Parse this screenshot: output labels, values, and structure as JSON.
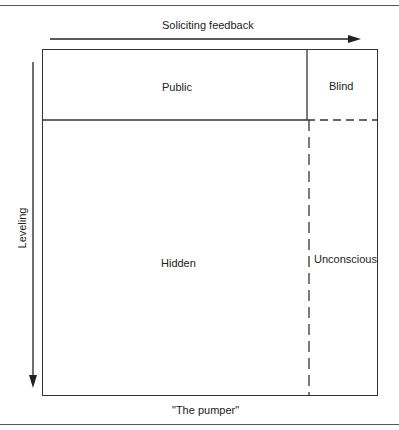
{
  "diagram": {
    "top_arrow_label": "Soliciting feedback",
    "left_arrow_label": "Leveling",
    "caption": "\"The pumper\"",
    "quadrants": {
      "top_left": "Public",
      "top_right": "Blind",
      "bottom_left": "Hidden",
      "bottom_right": "Unconscious"
    }
  }
}
